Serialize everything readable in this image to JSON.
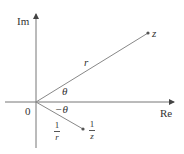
{
  "diagram": {
    "axes": {
      "horizontal_label": "Re",
      "vertical_label": "Im",
      "origin_label": "0"
    },
    "points": [
      {
        "name": "z",
        "label": "z",
        "modulus_label": "r",
        "angle_label": "θ"
      },
      {
        "name": "1/z",
        "label_num": "1",
        "label_den": "z",
        "modulus_label_num": "1",
        "modulus_label_den": "r",
        "angle_label": "−θ"
      }
    ],
    "colors": {
      "line": "#777777",
      "text": "#333333",
      "point": "#555555"
    }
  }
}
